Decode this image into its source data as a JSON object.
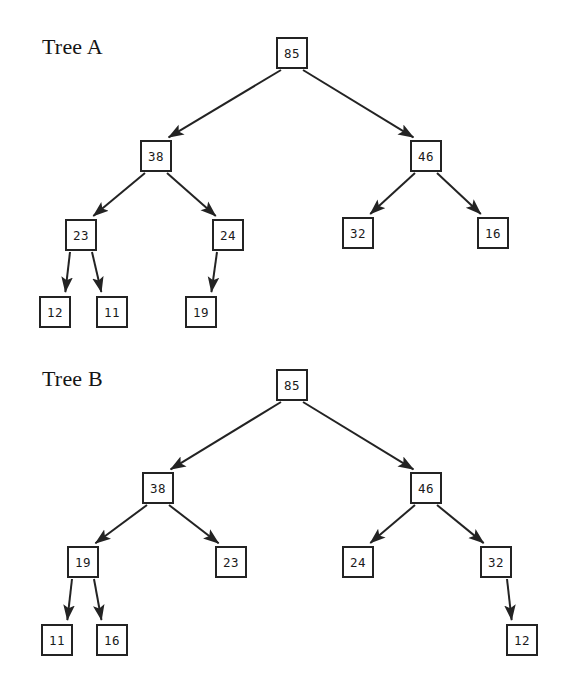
{
  "page": {
    "width": 567,
    "height": 679,
    "background": "#ffffff",
    "ink_color": "#232323"
  },
  "chart_data": {
    "type": "diagram",
    "diagram_kind": "binary-tree-pair",
    "title": "",
    "trees": [
      {
        "label": "Tree A",
        "label_pos": {
          "x": 42,
          "y": 34
        },
        "root": "85",
        "nodes": [
          {
            "id": "a-85",
            "value": "85",
            "x": 276,
            "y": 37,
            "level": 0
          },
          {
            "id": "a-38",
            "value": "38",
            "x": 140,
            "y": 140,
            "level": 1
          },
          {
            "id": "a-46",
            "value": "46",
            "x": 410,
            "y": 140,
            "level": 1
          },
          {
            "id": "a-23",
            "value": "23",
            "x": 65,
            "y": 219,
            "level": 2
          },
          {
            "id": "a-24",
            "value": "24",
            "x": 212,
            "y": 219,
            "level": 2
          },
          {
            "id": "a-32",
            "value": "32",
            "x": 342,
            "y": 217,
            "level": 2
          },
          {
            "id": "a-16",
            "value": "16",
            "x": 477,
            "y": 217,
            "level": 2
          },
          {
            "id": "a-12",
            "value": "12",
            "x": 39,
            "y": 296,
            "level": 3
          },
          {
            "id": "a-11",
            "value": "11",
            "x": 96,
            "y": 296,
            "level": 3
          },
          {
            "id": "a-19",
            "value": "19",
            "x": 185,
            "y": 296,
            "level": 3
          }
        ],
        "edges": [
          {
            "from": "a-85",
            "to": "a-38",
            "side": "left"
          },
          {
            "from": "a-85",
            "to": "a-46",
            "side": "right"
          },
          {
            "from": "a-38",
            "to": "a-23",
            "side": "left"
          },
          {
            "from": "a-38",
            "to": "a-24",
            "side": "right"
          },
          {
            "from": "a-46",
            "to": "a-32",
            "side": "left"
          },
          {
            "from": "a-46",
            "to": "a-16",
            "side": "right"
          },
          {
            "from": "a-23",
            "to": "a-12",
            "side": "left"
          },
          {
            "from": "a-23",
            "to": "a-11",
            "side": "right"
          },
          {
            "from": "a-24",
            "to": "a-19",
            "side": "left"
          }
        ]
      },
      {
        "label": "Tree B",
        "label_pos": {
          "x": 42,
          "y": 366
        },
        "root": "85",
        "nodes": [
          {
            "id": "b-85",
            "value": "85",
            "x": 276,
            "y": 369,
            "level": 0
          },
          {
            "id": "b-38",
            "value": "38",
            "x": 142,
            "y": 472,
            "level": 1
          },
          {
            "id": "b-46",
            "value": "46",
            "x": 410,
            "y": 472,
            "level": 1
          },
          {
            "id": "b-19",
            "value": "19",
            "x": 67,
            "y": 546,
            "level": 2
          },
          {
            "id": "b-23",
            "value": "23",
            "x": 215,
            "y": 546,
            "level": 2
          },
          {
            "id": "b-24",
            "value": "24",
            "x": 342,
            "y": 546,
            "level": 2
          },
          {
            "id": "b-32",
            "value": "32",
            "x": 480,
            "y": 546,
            "level": 2
          },
          {
            "id": "b-11",
            "value": "11",
            "x": 41,
            "y": 624,
            "level": 3
          },
          {
            "id": "b-16",
            "value": "16",
            "x": 96,
            "y": 624,
            "level": 3
          },
          {
            "id": "b-12",
            "value": "12",
            "x": 506,
            "y": 624,
            "level": 3
          }
        ],
        "edges": [
          {
            "from": "b-85",
            "to": "b-38",
            "side": "left"
          },
          {
            "from": "b-85",
            "to": "b-46",
            "side": "right"
          },
          {
            "from": "b-38",
            "to": "b-19",
            "side": "left"
          },
          {
            "from": "b-38",
            "to": "b-23",
            "side": "right"
          },
          {
            "from": "b-46",
            "to": "b-24",
            "side": "left"
          },
          {
            "from": "b-46",
            "to": "b-32",
            "side": "right"
          },
          {
            "from": "b-19",
            "to": "b-11",
            "side": "left"
          },
          {
            "from": "b-19",
            "to": "b-16",
            "side": "right"
          },
          {
            "from": "b-32",
            "to": "b-12",
            "side": "right"
          }
        ]
      }
    ]
  }
}
